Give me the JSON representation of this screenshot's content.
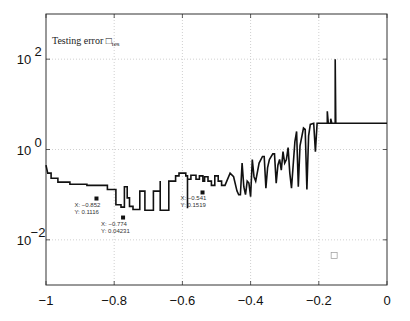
{
  "chart_data": {
    "type": "line",
    "title": "",
    "xlabel": "",
    "ylabel": "",
    "xlim": [
      -1,
      0
    ],
    "ylim": [
      0.001,
      1000
    ],
    "yscale": "log",
    "grid": true,
    "x_ticks": [
      -1,
      -0.8,
      -0.6,
      -0.4,
      -0.2,
      0
    ],
    "x_tick_labels": [
      "−1",
      "−0.8",
      "−0.6",
      "−0.4",
      "−0.2",
      "0"
    ],
    "y_ticks": [
      0.01,
      1,
      100
    ],
    "y_tick_labels": [
      {
        "base": "10",
        "exp": "−2"
      },
      {
        "base": "10",
        "exp": "0"
      },
      {
        "base": "10",
        "exp": "2"
      }
    ],
    "legend": {
      "text": "Testing error □",
      "subscript": "tes",
      "position": "upper-left"
    },
    "series": [
      {
        "name": "Testing error",
        "color": "#111111",
        "points": [
          [
            -1.0,
            0.45
          ],
          [
            -0.995,
            0.3
          ],
          [
            -0.985,
            0.3
          ],
          [
            -0.985,
            0.23
          ],
          [
            -0.965,
            0.23
          ],
          [
            -0.965,
            0.19
          ],
          [
            -0.93,
            0.19
          ],
          [
            -0.93,
            0.17
          ],
          [
            -0.88,
            0.17
          ],
          [
            -0.88,
            0.16
          ],
          [
            -0.82,
            0.16
          ],
          [
            -0.82,
            0.13
          ],
          [
            -0.795,
            0.13
          ],
          [
            -0.795,
            0.06
          ],
          [
            -0.78,
            0.06
          ],
          [
            -0.78,
            0.053
          ],
          [
            -0.77,
            0.053
          ],
          [
            -0.77,
            0.15
          ],
          [
            -0.762,
            0.15
          ],
          [
            -0.762,
            0.085
          ],
          [
            -0.755,
            0.085
          ],
          [
            -0.755,
            0.055
          ],
          [
            -0.745,
            0.055
          ],
          [
            -0.745,
            0.047
          ],
          [
            -0.725,
            0.047
          ],
          [
            -0.725,
            0.12
          ],
          [
            -0.71,
            0.12
          ],
          [
            -0.71,
            0.045
          ],
          [
            -0.685,
            0.045
          ],
          [
            -0.685,
            0.12
          ],
          [
            -0.665,
            0.12
          ],
          [
            -0.665,
            0.2
          ],
          [
            -0.665,
            0.045
          ],
          [
            -0.64,
            0.045
          ],
          [
            -0.64,
            0.2
          ],
          [
            -0.62,
            0.2
          ],
          [
            -0.62,
            0.26
          ],
          [
            -0.61,
            0.26
          ],
          [
            -0.61,
            0.3
          ],
          [
            -0.59,
            0.3
          ],
          [
            -0.59,
            0.26
          ],
          [
            -0.585,
            0.26
          ],
          [
            -0.585,
            0.05
          ],
          [
            -0.585,
            0.22
          ],
          [
            -0.575,
            0.22
          ],
          [
            -0.575,
            0.27
          ],
          [
            -0.56,
            0.27
          ],
          [
            -0.56,
            0.22
          ],
          [
            -0.55,
            0.22
          ],
          [
            -0.55,
            0.26
          ],
          [
            -0.54,
            0.26
          ],
          [
            -0.54,
            0.2
          ],
          [
            -0.535,
            0.2
          ],
          [
            -0.535,
            0.25
          ],
          [
            -0.525,
            0.25
          ],
          [
            -0.525,
            0.2
          ],
          [
            -0.515,
            0.2
          ],
          [
            -0.515,
            0.16
          ],
          [
            -0.505,
            0.16
          ],
          [
            -0.505,
            0.26
          ],
          [
            -0.495,
            0.26
          ],
          [
            -0.495,
            0.2
          ],
          [
            -0.485,
            0.2
          ],
          [
            -0.485,
            0.16
          ],
          [
            -0.475,
            0.16
          ],
          [
            -0.46,
            0.3
          ],
          [
            -0.45,
            0.25
          ],
          [
            -0.44,
            0.12
          ],
          [
            -0.435,
            0.1
          ],
          [
            -0.43,
            0.1
          ],
          [
            -0.425,
            0.5
          ],
          [
            -0.42,
            0.15
          ],
          [
            -0.415,
            0.1
          ],
          [
            -0.41,
            0.2
          ],
          [
            -0.405,
            0.18
          ],
          [
            -0.4,
            0.09
          ],
          [
            -0.395,
            0.6
          ],
          [
            -0.39,
            0.25
          ],
          [
            -0.385,
            0.2
          ],
          [
            -0.375,
            0.5
          ],
          [
            -0.365,
            0.7
          ],
          [
            -0.36,
            0.7
          ],
          [
            -0.355,
            0.14
          ],
          [
            -0.35,
            0.4
          ],
          [
            -0.345,
            0.6
          ],
          [
            -0.335,
            0.8
          ],
          [
            -0.33,
            0.8
          ],
          [
            -0.325,
            0.18
          ],
          [
            -0.32,
            0.45
          ],
          [
            -0.315,
            0.6
          ],
          [
            -0.31,
            0.35
          ],
          [
            -0.305,
            0.9
          ],
          [
            -0.3,
            0.5
          ],
          [
            -0.295,
            0.6
          ],
          [
            -0.29,
            1.1
          ],
          [
            -0.285,
            0.3
          ],
          [
            -0.28,
            0.14
          ],
          [
            -0.27,
            1.5
          ],
          [
            -0.265,
            2.5
          ],
          [
            -0.26,
            0.15
          ],
          [
            -0.255,
            1.2
          ],
          [
            -0.245,
            3.0
          ],
          [
            -0.24,
            2.8
          ],
          [
            -0.235,
            0.13
          ],
          [
            -0.23,
            2.0
          ],
          [
            -0.225,
            3.6
          ],
          [
            -0.215,
            3.8
          ],
          [
            -0.21,
            0.9
          ],
          [
            -0.205,
            3.8
          ],
          [
            -0.175,
            3.8
          ],
          [
            -0.175,
            7.0
          ],
          [
            -0.172,
            3.8
          ],
          [
            -0.165,
            3.8
          ],
          [
            -0.165,
            4.8
          ],
          [
            -0.162,
            3.8
          ],
          [
            -0.152,
            3.8
          ],
          [
            -0.152,
            100
          ],
          [
            -0.15,
            3.8
          ],
          [
            -0.1,
            3.8
          ],
          [
            0.0,
            3.8
          ]
        ]
      }
    ],
    "data_tips": [
      {
        "x": -0.852,
        "y": 0.1116,
        "label_x": "X: −0.852",
        "label_y": "Y: 0.1116"
      },
      {
        "x": -0.774,
        "y": 0.04231,
        "label_x": "X: −0.774",
        "label_y": "Y: 0.04231"
      },
      {
        "x": -0.541,
        "y": 0.1519,
        "label_x": "X: −0.541",
        "label_y": "Y: 0.1519"
      }
    ],
    "annotations": [
      {
        "type": "empty-square",
        "x": -0.155,
        "y": 0.0045
      }
    ]
  },
  "layout": {
    "axes_px": {
      "left": 46,
      "top": 14,
      "right": 387,
      "bottom": 285
    }
  }
}
